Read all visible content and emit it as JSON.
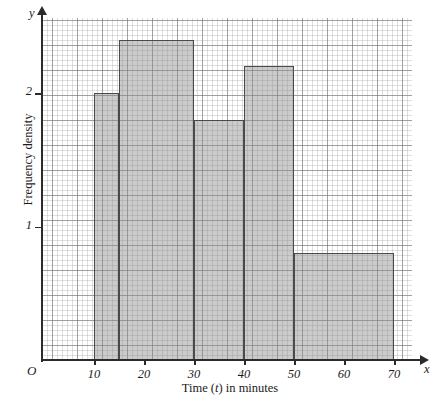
{
  "chart_data": {
    "type": "bar",
    "subtype": "histogram",
    "title": "",
    "xlabel": "Time (t) in minutes",
    "ylabel": "Frequency density",
    "xlim": [
      0,
      72
    ],
    "ylim": [
      0,
      2.62
    ],
    "grid": true,
    "grid_style": "graph-paper",
    "legend": "none",
    "x_ticks": [
      10,
      20,
      30,
      40,
      50,
      60,
      70
    ],
    "y_ticks": [
      1,
      2
    ],
    "origin_label": "O",
    "x_axis_symbol": "x",
    "y_axis_symbol": "y",
    "bars": [
      {
        "label": "10-15",
        "x_start": 10,
        "x_end": 15,
        "height": 2.0
      },
      {
        "label": "15-30",
        "x_start": 15,
        "x_end": 30,
        "height": 2.4
      },
      {
        "label": "30-40",
        "x_start": 30,
        "x_end": 40,
        "height": 1.8
      },
      {
        "label": "40-50",
        "x_start": 40,
        "x_end": 50,
        "height": 2.2
      },
      {
        "label": "50-70",
        "x_start": 50,
        "x_end": 70,
        "height": 0.8
      }
    ],
    "bar_fill_color": "#8c8c8c",
    "bar_edge_color": "#4a4a4a",
    "axis_color": "#2b2b2b"
  }
}
